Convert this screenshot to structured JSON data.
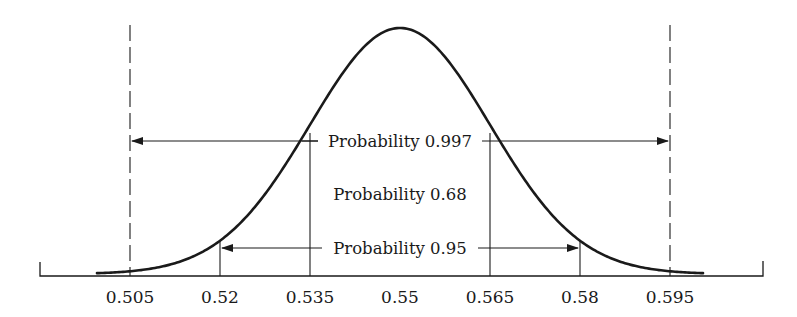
{
  "chart_data": {
    "type": "line",
    "title": "",
    "xlabel": "",
    "ylabel": "",
    "distribution": {
      "mean": 0.55,
      "sd": 0.015
    },
    "x_ticks": [
      "0.505",
      "0.52",
      "0.535",
      "0.55",
      "0.565",
      "0.58",
      "0.595"
    ],
    "x_tick_values": [
      0.505,
      0.52,
      0.535,
      0.55,
      0.565,
      0.58,
      0.595
    ],
    "xlim": [
      0.4975,
      0.6025
    ],
    "grid": false,
    "legend": null,
    "intervals": [
      {
        "label": "Probability 0.68",
        "probability": 0.68,
        "from": 0.535,
        "to": 0.565,
        "line_style": "solid"
      },
      {
        "label": "Probability 0.95",
        "probability": 0.95,
        "from": 0.52,
        "to": 0.58,
        "line_style": "solid"
      },
      {
        "label": "Probability 0.997",
        "probability": 0.997,
        "from": 0.505,
        "to": 0.595,
        "line_style": "dashed"
      }
    ]
  },
  "labels": {
    "p997": "Probability 0.997",
    "p68": "Probability 0.68",
    "p95": "Probability 0.95"
  },
  "colors": {
    "ink": "#1a1a1a",
    "background": "#ffffff"
  }
}
